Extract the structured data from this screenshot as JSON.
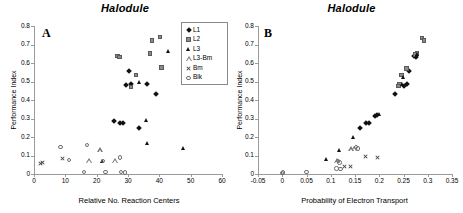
{
  "figure": {
    "panels": [
      {
        "id": "A",
        "label": "A",
        "title": "Halodule",
        "xlabel": "Relative No. Reaction Centers",
        "ylabel": "Performance Index"
      },
      {
        "id": "B",
        "label": "B",
        "title": "Halodule",
        "xlabel": "Probability of Electron Transport",
        "ylabel": "Performance Index"
      }
    ]
  },
  "legend": {
    "position": "top-right-panel-a",
    "entries": [
      {
        "label": "L1",
        "marker": "filled-diamond",
        "color": "#111111"
      },
      {
        "label": "L2",
        "marker": "filled-square",
        "color": "#8b8b8b"
      },
      {
        "label": "L3",
        "marker": "filled-triangle",
        "color": "#111111"
      },
      {
        "label": "L3-Bm",
        "marker": "open-triangle",
        "color": "#777777"
      },
      {
        "label": "Bm",
        "marker": "cross",
        "color": "#444444"
      },
      {
        "label": "Blk",
        "marker": "open-circle",
        "color": "#6e6e6e"
      }
    ]
  },
  "chart_data": [
    {
      "type": "scatter",
      "panel": "A",
      "title": "Halodule",
      "xlabel": "Relative No. Reaction Centers",
      "ylabel": "Performance Index",
      "xlim": [
        0,
        60
      ],
      "ylim": [
        0,
        0.8
      ],
      "xticks": [
        0,
        10,
        20,
        30,
        40,
        50,
        60
      ],
      "xtick_labels": [
        "0",
        "10",
        "20",
        "30",
        "40",
        "50",
        "60"
      ],
      "yticks": [
        0,
        0.1,
        0.2,
        0.3,
        0.4,
        0.5,
        0.6,
        0.7,
        0.8
      ],
      "ytick_labels": [
        "0",
        "0.1",
        "0.2",
        "0.3",
        "0.4",
        "0.5",
        "0.6",
        "0.7",
        "0.8"
      ],
      "grid": false,
      "series": [
        {
          "name": "L1",
          "marker": "filled-diamond",
          "points": [
            [
              30.2,
              0.555
            ],
            [
              29.4,
              0.483
            ],
            [
              31.0,
              0.487
            ],
            [
              36.0,
              0.487
            ],
            [
              38.8,
              0.433
            ],
            [
              25.6,
              0.285
            ],
            [
              27.4,
              0.278
            ],
            [
              28.4,
              0.278
            ],
            [
              33.4,
              0.247
            ]
          ]
        },
        {
          "name": "L2",
          "marker": "filled-square",
          "points": [
            [
              26.6,
              0.638
            ],
            [
              27.2,
              0.632
            ],
            [
              37.6,
              0.722
            ],
            [
              40.2,
              0.74
            ],
            [
              37.0,
              0.652
            ],
            [
              40.6,
              0.575
            ],
            [
              32.6,
              0.535
            ],
            [
              31.0,
              0.47
            ]
          ]
        },
        {
          "name": "L3",
          "marker": "filled-triangle",
          "points": [
            [
              43.0,
              0.662
            ],
            [
              33.8,
              0.497
            ],
            [
              35.8,
              0.288
            ],
            [
              36.4,
              0.167
            ],
            [
              47.6,
              0.14
            ],
            [
              21.8,
              0.07
            ]
          ]
        },
        {
          "name": "L3-Bm",
          "marker": "open-triangle",
          "points": [
            [
              21.0,
              0.13
            ],
            [
              17.6,
              0.075
            ],
            [
              25.8,
              0.073
            ]
          ]
        },
        {
          "name": "Bm",
          "marker": "cross",
          "points": [
            [
              2.6,
              0.062
            ],
            [
              2.2,
              0.055
            ],
            [
              9.2,
              0.083
            ]
          ]
        },
        {
          "name": "Blk",
          "marker": "open-circle",
          "points": [
            [
              8.4,
              0.145
            ],
            [
              17.0,
              0.158
            ],
            [
              11.2,
              0.075
            ],
            [
              22.0,
              0.07
            ],
            [
              27.4,
              0.09
            ],
            [
              16.0,
              0.012
            ],
            [
              22.8,
              0.01
            ],
            [
              27.8,
              0.01
            ],
            [
              29.0,
              0.008
            ]
          ]
        }
      ]
    },
    {
      "type": "scatter",
      "panel": "B",
      "title": "Halodule",
      "xlabel": "Probability of Electron Transport",
      "ylabel": "Performance Index",
      "xlim": [
        -0.05,
        0.35
      ],
      "ylim": [
        0,
        0.8
      ],
      "xticks": [
        -0.05,
        0,
        0.05,
        0.1,
        0.15,
        0.2,
        0.25,
        0.3,
        0.35
      ],
      "xtick_labels": [
        "-0.05",
        "0",
        "0.05",
        "0.1",
        "0.15",
        "0.2",
        "0.25",
        "0.3",
        "0.35"
      ],
      "yticks": [
        0,
        0.1,
        0.2,
        0.3,
        0.4,
        0.5,
        0.6,
        0.7,
        0.8
      ],
      "ytick_labels": [
        "0",
        "0.1",
        "0.2",
        "0.3",
        "0.4",
        "0.5",
        "0.6",
        "0.7",
        "0.8"
      ],
      "grid": false,
      "series": [
        {
          "name": "L1",
          "marker": "filled-diamond",
          "points": [
            [
              0.272,
              0.637
            ],
            [
              0.276,
              0.63
            ],
            [
              0.262,
              0.555
            ],
            [
              0.258,
              0.487
            ],
            [
              0.252,
              0.478
            ],
            [
              0.232,
              0.433
            ],
            [
              0.196,
              0.32
            ],
            [
              0.192,
              0.315
            ],
            [
              0.178,
              0.278
            ],
            [
              0.172,
              0.275
            ],
            [
              0.16,
              0.247
            ]
          ]
        },
        {
          "name": "L2",
          "marker": "filled-square",
          "points": [
            [
              0.288,
              0.735
            ],
            [
              0.292,
              0.722
            ],
            [
              0.278,
              0.652
            ],
            [
              0.274,
              0.645
            ],
            [
              0.256,
              0.57
            ],
            [
              0.246,
              0.535
            ],
            [
              0.242,
              0.487
            ],
            [
              0.24,
              0.475
            ]
          ]
        },
        {
          "name": "L3",
          "marker": "filled-triangle",
          "points": [
            [
              0.28,
              0.648
            ],
            [
              0.278,
              0.636
            ],
            [
              0.25,
              0.52
            ],
            [
              0.248,
              0.487
            ],
            [
              0.2,
              0.32
            ],
            [
              0.148,
              0.198
            ],
            [
              0.118,
              0.13
            ],
            [
              0.092,
              0.078
            ]
          ]
        },
        {
          "name": "L3-Bm",
          "marker": "open-triangle",
          "points": [
            [
              0.148,
              0.14
            ],
            [
              0.142,
              0.135
            ],
            [
              0.112,
              0.072
            ]
          ]
        },
        {
          "name": "Bm",
          "marker": "cross",
          "points": [
            [
              0.172,
              0.092
            ],
            [
              0.196,
              0.09
            ],
            [
              0.128,
              0.04
            ],
            [
              0.14,
              0.04
            ]
          ]
        },
        {
          "name": "Blk",
          "marker": "open-circle",
          "points": [
            [
              0.152,
              0.145
            ],
            [
              0.156,
              0.138
            ],
            [
              0.115,
              0.07
            ],
            [
              0.118,
              0.062
            ],
            [
              0.112,
              0.03
            ],
            [
              0.12,
              0.028
            ],
            [
              0.05,
              0.012
            ],
            [
              0.002,
              0.008
            ],
            [
              0.0,
              0.006
            ]
          ]
        }
      ]
    }
  ]
}
